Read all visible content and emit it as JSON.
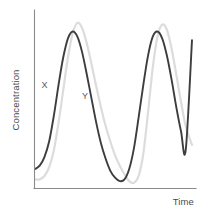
{
  "chart_data": {
    "type": "line",
    "title": "",
    "subtitle": "",
    "xlabel": "Time",
    "ylabel": "Concentration",
    "grid": false,
    "legend_position": "inline-annotation",
    "axis_ticks": "none",
    "xlim": [
      0,
      100
    ],
    "ylim": [
      0,
      100
    ],
    "annotations": [
      {
        "text": "X",
        "series": "X",
        "x": 4.2,
        "y": 58.0
      },
      {
        "text": "Y",
        "series": "Y",
        "x": 30.0,
        "y": 51.5
      }
    ],
    "series": [
      {
        "name": "X",
        "color": "#3d3d3d",
        "stroke_width": 1.9,
        "description": "Dark oscillating curve, leads Y in phase; two full peaks visible and a third rising at the right edge.",
        "x": [
          0,
          3,
          6,
          9,
          12,
          15,
          18,
          21,
          24,
          27,
          30,
          33,
          36,
          39,
          42,
          45,
          48,
          51,
          54,
          57,
          60,
          63,
          66,
          69,
          72,
          75,
          78,
          81,
          84,
          87,
          90,
          93,
          96,
          100
        ],
        "y": [
          11,
          13,
          18,
          27,
          42,
          60,
          76,
          87,
          91,
          88,
          79,
          66,
          52,
          38,
          26,
          17,
          10,
          6,
          4,
          5,
          11,
          23,
          41,
          60,
          77,
          88,
          91,
          87,
          77,
          63,
          47,
          33,
          22,
          86
        ]
      },
      {
        "name": "Y",
        "color": "#dcdcdc",
        "stroke_width": 2.2,
        "description": "Light gray oscillating curve, lags X by roughly a quarter period; peaks slightly higher than X.",
        "x": [
          0,
          3,
          6,
          9,
          12,
          15,
          18,
          21,
          24,
          27,
          30,
          33,
          36,
          39,
          42,
          45,
          48,
          51,
          54,
          57,
          60,
          63,
          66,
          69,
          72,
          75,
          78,
          81,
          84,
          87,
          90,
          93,
          96,
          100
        ],
        "y": [
          5,
          5,
          7,
          12,
          22,
          38,
          57,
          76,
          90,
          96,
          93,
          84,
          72,
          59,
          47,
          36,
          27,
          19,
          13,
          8,
          4,
          3,
          7,
          20,
          44,
          70,
          88,
          95,
          92,
          81,
          66,
          50,
          36,
          25
        ]
      }
    ]
  },
  "labels": {
    "y_axis_title": "Concentration",
    "x_axis_title": "Time",
    "series_x": "X",
    "series_y": "Y"
  },
  "colors": {
    "background": "#ffffff",
    "axis": "#8a8a8a",
    "series_x": "#3d3d3d",
    "series_y": "#dcdcdc",
    "label_text": "#4a4a4a",
    "annotation_text": "#5a5a5a"
  }
}
